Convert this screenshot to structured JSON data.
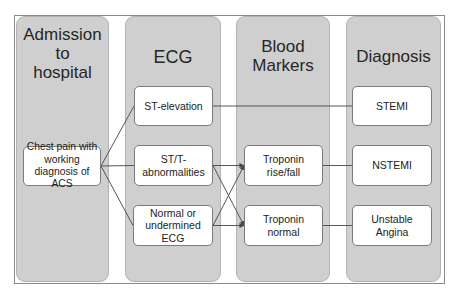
{
  "columns": [
    {
      "id": "admission",
      "title": "Admission to hospital",
      "title_lines": [
        "Admission",
        "to",
        "hospital"
      ]
    },
    {
      "id": "ecg",
      "title": "ECG",
      "title_lines": [
        "ECG"
      ]
    },
    {
      "id": "blood",
      "title": "Blood Markers",
      "title_lines": [
        "Blood",
        "Markers"
      ]
    },
    {
      "id": "diagnosis",
      "title": "Diagnosis",
      "title_lines": [
        "Diagnosis"
      ]
    }
  ],
  "boxes": {
    "chest_pain": "Chest pain with working diagnosis of ACS",
    "st_elevation": "ST-elevation",
    "st_t_abnormalities": "ST/T-abnormalities",
    "normal_ecg": "Normal or undermined ECG",
    "troponin_rise": "Troponin rise/fall",
    "troponin_normal": "Troponin normal",
    "stemi": "STEMI",
    "nstemi": "NSTEMI",
    "unstable_angina": "Unstable Angina"
  },
  "connections": [
    {
      "from": "chest_pain",
      "to": "st_elevation",
      "arrow": false
    },
    {
      "from": "chest_pain",
      "to": "st_t_abnormalities",
      "arrow": false
    },
    {
      "from": "chest_pain",
      "to": "normal_ecg",
      "arrow": false
    },
    {
      "from": "st_elevation",
      "to": "stemi",
      "arrow": false
    },
    {
      "from": "st_t_abnormalities",
      "to": "troponin_rise",
      "arrow": true
    },
    {
      "from": "st_t_abnormalities",
      "to": "troponin_normal",
      "arrow": true
    },
    {
      "from": "normal_ecg",
      "to": "troponin_rise",
      "arrow": true
    },
    {
      "from": "normal_ecg",
      "to": "troponin_normal",
      "arrow": true
    },
    {
      "from": "troponin_rise",
      "to": "nstemi",
      "arrow": false
    },
    {
      "from": "troponin_normal",
      "to": "unstable_angina",
      "arrow": false
    }
  ],
  "colors": {
    "column_fill": "#cfcfcf",
    "box_fill": "#ffffff",
    "line": "#555555"
  }
}
